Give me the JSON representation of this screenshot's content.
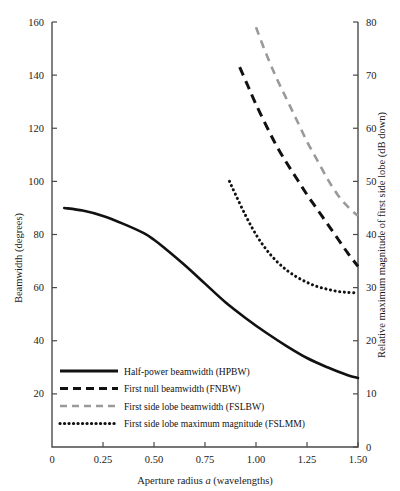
{
  "chart_data": {
    "type": "line",
    "title": "",
    "xlabel": "Aperture radius a (wavelengths)",
    "ylabel": "Beamwidth (degrees)",
    "y2label": "Relative maximum magnitude of first side lobe (dB down)",
    "xlim": [
      0,
      1.5
    ],
    "ylim": [
      0,
      160
    ],
    "y2lim": [
      0,
      80
    ],
    "grid": false,
    "legend_position": "inside lower-left",
    "xticks": [
      "0",
      "0.25",
      "0.50",
      "0.75",
      "1.00",
      "1.25",
      "1.50"
    ],
    "xtick_values": [
      0,
      0.25,
      0.5,
      0.75,
      1.0,
      1.25,
      1.5
    ],
    "yticks": [
      "20",
      "40",
      "60",
      "80",
      "100",
      "120",
      "140",
      "160"
    ],
    "ytick_values": [
      20,
      40,
      60,
      80,
      100,
      120,
      140,
      160
    ],
    "y2ticks": [
      "0",
      "10",
      "20",
      "30",
      "40",
      "50",
      "60",
      "70",
      "80"
    ],
    "y2tick_values": [
      0,
      10,
      20,
      30,
      40,
      50,
      60,
      70,
      80
    ],
    "series": [
      {
        "name": "Half-power beamwidth (HPBW)",
        "short": "HPBW",
        "style": "solid",
        "color": "#111111",
        "axis": "left",
        "x": [
          0.06,
          0.15,
          0.25,
          0.35,
          0.45,
          0.5,
          0.55,
          0.65,
          0.75,
          0.85,
          0.95,
          1.05,
          1.15,
          1.25,
          1.35,
          1.45,
          1.5
        ],
        "values": [
          90.0,
          89.0,
          87.0,
          84.0,
          80.5,
          78.0,
          75.0,
          68.5,
          61.5,
          54.5,
          48.5,
          43.0,
          38.0,
          33.5,
          30.0,
          27.0,
          26.0
        ]
      },
      {
        "name": "First null beamwidth (FNBW)",
        "short": "FNBW",
        "style": "dashed",
        "color": "#111111",
        "axis": "left",
        "x": [
          0.92,
          0.96,
          1.0,
          1.05,
          1.1,
          1.15,
          1.2,
          1.25,
          1.3,
          1.35,
          1.4,
          1.45,
          1.5
        ],
        "values": [
          143.0,
          136.0,
          129.0,
          121.0,
          113.5,
          107.0,
          101.0,
          95.0,
          89.5,
          84.0,
          78.5,
          73.0,
          68.0
        ]
      },
      {
        "name": "First side lobe beamwidth (FSLBW)",
        "short": "FSLBW",
        "style": "gray-dashed",
        "color": "#9a9a9a",
        "axis": "left",
        "x": [
          1.0,
          1.05,
          1.1,
          1.15,
          1.2,
          1.25,
          1.3,
          1.35,
          1.4,
          1.45,
          1.5
        ],
        "values": [
          158.0,
          148.0,
          139.0,
          131.0,
          123.0,
          115.0,
          108.0,
          101.0,
          95.0,
          90.5,
          87.0
        ]
      },
      {
        "name": "First side lobe maximum magnitude (FSLMM)",
        "short": "FSLMM",
        "style": "dotted",
        "color": "#111111",
        "axis": "right",
        "x": [
          0.87,
          0.9,
          0.95,
          1.0,
          1.05,
          1.1,
          1.15,
          1.2,
          1.25,
          1.3,
          1.35,
          1.4,
          1.45,
          1.5
        ],
        "values": [
          50.0,
          47.5,
          43.5,
          40.0,
          37.2,
          35.0,
          33.3,
          32.0,
          31.0,
          30.2,
          29.7,
          29.3,
          29.1,
          29.0
        ]
      }
    ],
    "legend": [
      "Half-power beamwidth (HPBW)",
      "First null beamwidth (FNBW)",
      "First side lobe beamwidth (FSLBW)",
      "First side lobe maximum magnitude (FSLMM)"
    ]
  }
}
